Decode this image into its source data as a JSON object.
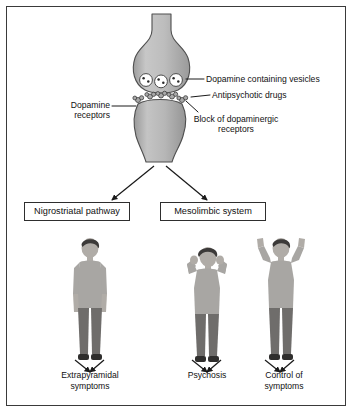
{
  "figure": {
    "border_color": "#3a3a3a",
    "neuron_fill": "#b9b9b9",
    "neuron_stroke": "#4a4a4a"
  },
  "synapse": {
    "presynaptic_label": "presynaptic-terminal",
    "postsynaptic_label": "postsynaptic-neuron",
    "vesicle_count": 3,
    "dots_per_vesicle": 2,
    "receptor_cluster_count": 5
  },
  "callouts": [
    {
      "id": "vesicles",
      "text": "Dopamine containing vesicles"
    },
    {
      "id": "antipsychotic",
      "text": "Antipsychotic drugs"
    },
    {
      "id": "receptors",
      "text": "Dopamine\nreceptors"
    },
    {
      "id": "block",
      "text": "Block of dopaminergic\nreceptors"
    }
  ],
  "callout_text": {
    "vesicles": "Dopamine containing vesicles",
    "antipsychotic": "Antipsychotic drugs",
    "receptors_line1": "Dopamine",
    "receptors_line2": "receptors",
    "block_line1": "Block of dopaminergic",
    "block_line2": "receptors"
  },
  "pathways": [
    {
      "id": "nigrostriatal",
      "label": "Nigrostriatal pathway"
    },
    {
      "id": "mesolimbic",
      "label": "Mesolimbic system"
    }
  ],
  "pathway_labels": {
    "nigrostriatal": "Nigrostriatal pathway",
    "mesolimbic": "Mesolimbic system"
  },
  "outcomes": [
    {
      "id": "extrapyramidal",
      "line1": "Extrapyramidal",
      "line2": "symptoms",
      "figure": "standing-man"
    },
    {
      "id": "psychosis",
      "line1": "Psychosis",
      "line2": "",
      "figure": "man-hands-to-head"
    },
    {
      "id": "control",
      "line1": "Control of",
      "line2": "symptoms",
      "figure": "man-arms-raised"
    }
  ],
  "outcome_text": {
    "extrapyramidal_line1": "Extrapyramidal",
    "extrapyramidal_line2": "symptoms",
    "psychosis_line1": "Psychosis",
    "psychosis_line2": "",
    "control_line1": "Control of",
    "control_line2": "symptoms"
  },
  "colors": {
    "skin": "#b0aca7",
    "hair": "#3c3a39",
    "shirt": "#a8a6a3",
    "pants": "#6f6d6b",
    "shoes": "#2f2e2d",
    "arrow": "#1a1a1a"
  }
}
